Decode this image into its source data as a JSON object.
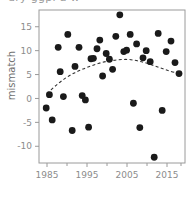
{
  "figure": {
    "clipped_top_text": "dry ggpl a w",
    "width": 195,
    "height": 207,
    "background": "#ffffff"
  },
  "axes": {
    "frame_color": "#9a9a9a",
    "tick_color": "#9a9a9a",
    "label_color": "#8c8c8c"
  },
  "chart_data": {
    "type": "scatter",
    "title": "",
    "subtitle": "",
    "xlabel": "",
    "ylabel": "mismatch",
    "xlim": [
      1983,
      2019.5
    ],
    "ylim": [
      -13.5,
      18.5
    ],
    "grid": false,
    "legend": null,
    "point_color": "#1a1a1a",
    "point_size": 3.4,
    "x_ticks_major": [
      1985,
      1995,
      2005,
      2015
    ],
    "x_tick_labels": [
      "1985",
      "1995",
      "2005",
      "2015"
    ],
    "x_ticks_minor": [
      1990,
      2000,
      2010,
      2018.5
    ],
    "y_ticks": [
      15,
      10,
      5,
      0,
      -5,
      -10
    ],
    "y_tick_labels": [
      "15",
      "10",
      "5",
      "0",
      "-5",
      "-10"
    ],
    "x": [
      1984.8,
      1985.6,
      1986.3,
      1987.8,
      1988.3,
      1989.1,
      1990.2,
      1991.3,
      1992.0,
      1993.0,
      1993.8,
      1994.6,
      1995.5,
      1996.0,
      1996.4,
      1997.2,
      1997.8,
      1998.8,
      1999.6,
      2000.4,
      2001.3,
      2002.1,
      2003.0,
      2004.0,
      2005.2,
      2006.3,
      2007.0,
      2007.6,
      2008.5,
      2009.5,
      2010.6,
      2011.4,
      2012.3,
      2013.3,
      2014.2,
      2015.3,
      2016.2,
      2017.3,
      2018.3
    ],
    "y": [
      -2.0,
      0.8,
      -4.5,
      10.7,
      5.6,
      0.4,
      13.4,
      -6.7,
      6.7,
      10.7,
      0.6,
      -0.3,
      -6.0,
      8.3,
      8.4,
      10.4,
      12.2,
      4.7,
      9.4,
      8.2,
      6.1,
      13.0,
      17.5,
      9.8,
      10.1,
      13.4,
      -1.0,
      11.4,
      -6.1,
      8.5,
      10.0,
      7.7,
      -12.3,
      13.6,
      -2.5,
      9.8,
      12.0,
      7.5,
      5.2
    ],
    "series": [
      {
        "name": "mismatch observations",
        "type": "scatter",
        "marker": "filled-circle",
        "color": "#1a1a1a",
        "points": [
          [
            1984.8,
            -2.0
          ],
          [
            1985.6,
            0.8
          ],
          [
            1986.3,
            -4.5
          ],
          [
            1987.8,
            10.7
          ],
          [
            1988.3,
            5.6
          ],
          [
            1989.1,
            0.4
          ],
          [
            1990.2,
            13.4
          ],
          [
            1991.3,
            -6.7
          ],
          [
            1992.0,
            6.7
          ],
          [
            1993.0,
            10.7
          ],
          [
            1993.8,
            0.6
          ],
          [
            1994.6,
            -0.3
          ],
          [
            1996.0,
            8.3
          ],
          [
            1996.6,
            8.4
          ],
          [
            1997.5,
            10.4
          ],
          [
            1998.2,
            12.2
          ],
          [
            1998.9,
            4.7
          ],
          [
            1999.8,
            9.4
          ],
          [
            2000.6,
            8.2
          ],
          [
            2001.4,
            6.1
          ],
          [
            2002.2,
            13.0
          ],
          [
            2003.2,
            17.5
          ],
          [
            2004.2,
            9.8
          ],
          [
            2004.9,
            10.1
          ],
          [
            2005.8,
            13.4
          ],
          [
            2006.6,
            -1.0
          ],
          [
            2007.4,
            11.4
          ],
          [
            2008.2,
            -6.1
          ],
          [
            2009.0,
            8.5
          ],
          [
            2009.8,
            10.0
          ],
          [
            2010.8,
            7.7
          ],
          [
            2011.8,
            -12.3
          ],
          [
            2012.8,
            13.6
          ],
          [
            2013.8,
            -2.5
          ],
          [
            2014.8,
            9.8
          ],
          [
            1995.4,
            -6.0
          ],
          [
            2016.0,
            12.0
          ],
          [
            2017.0,
            7.5
          ],
          [
            2018.0,
            5.2
          ]
        ]
      },
      {
        "name": "fitted trend",
        "type": "line",
        "linestyle": "dashed",
        "color": "#333333",
        "points": [
          [
            1985.0,
            1.0
          ],
          [
            1987.0,
            2.6
          ],
          [
            1989.0,
            3.9
          ],
          [
            1991.0,
            5.0
          ],
          [
            1993.0,
            5.8
          ],
          [
            1995.0,
            6.5
          ],
          [
            1997.0,
            7.1
          ],
          [
            1999.0,
            7.6
          ],
          [
            2001.0,
            7.9
          ],
          [
            2003.0,
            8.1
          ],
          [
            2005.0,
            8.2
          ],
          [
            2007.0,
            8.0
          ],
          [
            2009.0,
            7.6
          ],
          [
            2011.0,
            7.1
          ],
          [
            2013.0,
            6.5
          ],
          [
            2015.0,
            5.9
          ],
          [
            2017.0,
            5.4
          ],
          [
            2018.3,
            5.2
          ]
        ]
      }
    ],
    "annotations": []
  }
}
